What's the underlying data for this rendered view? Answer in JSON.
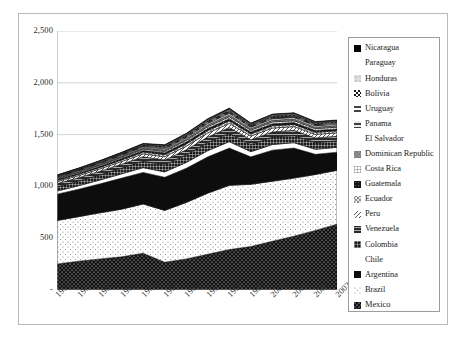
{
  "chart_data": {
    "type": "area",
    "stacked": true,
    "title": "",
    "xlabel": "",
    "ylabel": "",
    "categories": [
      "1990",
      "1991",
      "1992",
      "1993",
      "1994",
      "1995",
      "1996",
      "1997",
      "1998",
      "1999",
      "2000",
      "2001",
      "2002",
      "2003"
    ],
    "x": [
      1990,
      1991,
      1992,
      1993,
      1994,
      1995,
      1996,
      1997,
      1998,
      1999,
      2000,
      2001,
      2002,
      2003
    ],
    "ylim": [
      0,
      2500
    ],
    "ytick_labels": [
      "2,500",
      "2,000",
      "1,500",
      "1,000",
      "500",
      "-"
    ],
    "ytick_values": [
      2500,
      2000,
      1500,
      1000,
      500,
      0
    ],
    "grid": true,
    "legend_position": "right",
    "stack_order_bottom_to_top": [
      "Mexico",
      "Brazil",
      "Argentina",
      "Chile",
      "Colombia",
      "Venezuela",
      "Peru",
      "Ecuador",
      "Guatemala",
      "Costa Rica",
      "Dominican Republic",
      "El Salvador",
      "Panama",
      "Uruguay",
      "Bolivia",
      "Honduras",
      "Paraguay",
      "Nicaragua"
    ],
    "series": [
      {
        "name": "Mexico",
        "pattern": "dark-dot",
        "values": [
          250,
          278,
          300,
          320,
          355,
          268,
          300,
          345,
          390,
          420,
          470,
          520,
          575,
          635
        ]
      },
      {
        "name": "Brazil",
        "pattern": "light-dot",
        "values": [
          420,
          430,
          445,
          460,
          475,
          500,
          545,
          590,
          620,
          600,
          580,
          560,
          540,
          520
        ]
      },
      {
        "name": "Argentina",
        "pattern": "solid-dark",
        "values": [
          255,
          265,
          280,
          300,
          305,
          320,
          330,
          350,
          360,
          265,
          300,
          290,
          195,
          175
        ]
      },
      {
        "name": "Chile",
        "pattern": "white",
        "values": [
          30,
          33,
          37,
          41,
          46,
          52,
          56,
          60,
          62,
          50,
          54,
          52,
          48,
          47
        ]
      },
      {
        "name": "Colombia",
        "pattern": "mid-grid",
        "values": [
          42,
          46,
          50,
          56,
          63,
          70,
          74,
          80,
          82,
          70,
          72,
          70,
          65,
          63
        ]
      },
      {
        "name": "Venezuela",
        "pattern": "dark-grid",
        "values": [
          30,
          32,
          35,
          38,
          42,
          45,
          48,
          52,
          54,
          46,
          50,
          49,
          45,
          44
        ]
      },
      {
        "name": "Peru",
        "pattern": "hatch-light",
        "values": [
          18,
          20,
          22,
          25,
          28,
          32,
          35,
          38,
          40,
          35,
          37,
          36,
          34,
          33
        ]
      },
      {
        "name": "Ecuador",
        "pattern": "cross-hatch",
        "values": [
          12,
          13,
          14,
          16,
          18,
          20,
          22,
          24,
          25,
          21,
          22,
          21,
          20,
          20
        ]
      },
      {
        "name": "Guatemala",
        "pattern": "dark-dense",
        "values": [
          10,
          11,
          12,
          13,
          15,
          17,
          18,
          20,
          21,
          18,
          19,
          19,
          18,
          18
        ]
      },
      {
        "name": "Costa Rica",
        "pattern": "grid-light",
        "values": [
          8,
          9,
          10,
          11,
          13,
          15,
          16,
          18,
          19,
          17,
          18,
          18,
          17,
          17
        ]
      },
      {
        "name": "Dominican Republic",
        "pattern": "mid-gray",
        "values": [
          7,
          8,
          9,
          10,
          11,
          13,
          14,
          16,
          17,
          15,
          16,
          16,
          15,
          15
        ]
      },
      {
        "name": "El Salvador",
        "pattern": "white",
        "values": [
          6,
          7,
          8,
          9,
          10,
          11,
          12,
          14,
          15,
          13,
          14,
          14,
          13,
          13
        ]
      },
      {
        "name": "Panama",
        "pattern": "half-dark",
        "values": [
          5,
          6,
          6,
          7,
          8,
          9,
          10,
          11,
          12,
          10,
          11,
          11,
          10,
          10
        ]
      },
      {
        "name": "Uruguay",
        "pattern": "striped",
        "values": [
          5,
          5,
          6,
          6,
          7,
          8,
          9,
          10,
          10,
          9,
          9,
          9,
          8,
          8
        ]
      },
      {
        "name": "Bolivia",
        "pattern": "quad",
        "values": [
          4,
          4,
          5,
          5,
          6,
          7,
          7,
          8,
          9,
          7,
          8,
          8,
          7,
          7
        ]
      },
      {
        "name": "Honduras",
        "pattern": "light-gray",
        "values": [
          3,
          4,
          4,
          5,
          5,
          6,
          6,
          7,
          8,
          6,
          7,
          7,
          6,
          6
        ]
      },
      {
        "name": "Paraguay",
        "pattern": "white",
        "values": [
          3,
          3,
          4,
          4,
          4,
          5,
          5,
          6,
          6,
          5,
          6,
          6,
          5,
          5
        ]
      },
      {
        "name": "Nicaragua",
        "pattern": "solid-black",
        "values": [
          2,
          3,
          3,
          3,
          4,
          4,
          5,
          5,
          6,
          5,
          5,
          5,
          5,
          5
        ]
      }
    ],
    "totals": [
      1110,
      1147,
      1200,
      1259,
      1321,
      1322,
      1400,
      1554,
      1980,
      1500,
      1940,
      1790,
      1626,
      1700
    ]
  },
  "legend": {
    "items": [
      {
        "label": "Nicaragua"
      },
      {
        "label": "Paraguay"
      },
      {
        "label": "Honduras"
      },
      {
        "label": "Bolivia"
      },
      {
        "label": "Uruguay"
      },
      {
        "label": "Panama"
      },
      {
        "label": "El Salvador"
      },
      {
        "label": "Dominican Republic"
      },
      {
        "label": "Costa Rica"
      },
      {
        "label": "Guatemala"
      },
      {
        "label": "Ecuador"
      },
      {
        "label": "Peru"
      },
      {
        "label": "Venezuela"
      },
      {
        "label": "Colombia"
      },
      {
        "label": "Chile"
      },
      {
        "label": "Argentina"
      },
      {
        "label": "Brazil"
      },
      {
        "label": "Mexico"
      }
    ]
  },
  "colors": {
    "frame": "#b9b9b9",
    "legend_border": "#9c9c9c",
    "grid": "#c8c8c8",
    "axis": "#9a9a9a",
    "text": "#2b2b2b",
    "dark": "#121212",
    "light": "#ffffff"
  }
}
